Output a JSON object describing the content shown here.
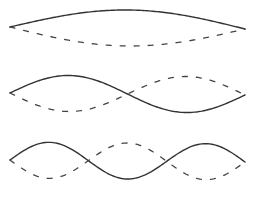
{
  "diagram": {
    "colors": {
      "solid": "#333333",
      "dashed": "#444444",
      "background": "#ffffff"
    },
    "modes": [
      {
        "name": "mode-1",
        "harmonic": 1,
        "x_start": 10,
        "x_end": 245,
        "y_start": 27,
        "y_end": 29,
        "amplitude": 18,
        "half_periods": 1
      },
      {
        "name": "mode-2",
        "harmonic": 2,
        "x_start": 10,
        "x_end": 245,
        "y_start": 93,
        "y_end": 95,
        "amplitude": 18,
        "half_periods": 2
      },
      {
        "name": "mode-3",
        "harmonic": 3,
        "x_start": 10,
        "x_end": 245,
        "y_start": 160,
        "y_end": 162,
        "amplitude": 18,
        "half_periods": 3
      }
    ]
  }
}
